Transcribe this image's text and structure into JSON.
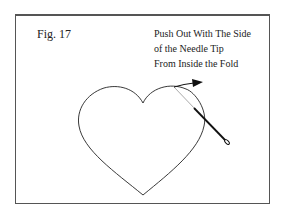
{
  "figure": {
    "label": "Fig. 17",
    "caption_lines": [
      "Push Out With The Side",
      "of the Needle Tip",
      "From Inside the Fold"
    ]
  },
  "icons": [
    "heart-outline",
    "needle",
    "arrow"
  ]
}
